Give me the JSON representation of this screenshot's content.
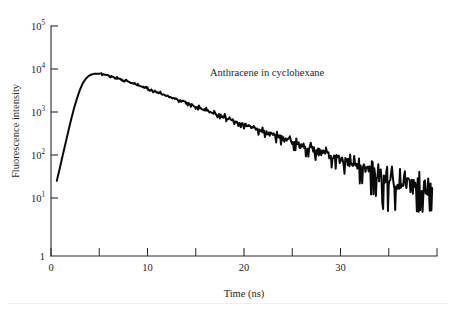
{
  "figure": {
    "annotation": "Anthracene in cyclohexane",
    "annotation_x": 210,
    "annotation_y": 76
  },
  "chart_data": {
    "type": "line",
    "title": "",
    "annotation": "Anthracene in cyclohexane",
    "xlabel": "Time (ns)",
    "ylabel": "Fluorescence intensity",
    "xscale": "linear",
    "yscale": "log",
    "xlim": [
      0,
      40
    ],
    "ylim": [
      1,
      100000
    ],
    "grid": false,
    "legend": null,
    "x_major_ticks": [
      0,
      10,
      20,
      30
    ],
    "x_major_tick_labels": [
      "0",
      "10",
      "20",
      "30"
    ],
    "x_minor_ticks": [
      5,
      15,
      25,
      35,
      40
    ],
    "y_ticks": [
      1,
      10,
      100,
      1000,
      10000,
      100000
    ],
    "y_tick_labels": [
      "1",
      "10",
      "10",
      "10",
      "10",
      "10"
    ],
    "y_tick_exponents": [
      "",
      "1",
      "2",
      "3",
      "4",
      "5"
    ],
    "series": [
      {
        "name": "Anthracene fluorescence decay",
        "color": "#0a0a0a",
        "peak_time_ns": 4.7,
        "peak_intensity": 7800,
        "lifetime_ns": 4.8,
        "x": [
          0.6,
          0.9,
          1.2,
          1.5,
          1.8,
          2.1,
          2.4,
          2.7,
          3.0,
          3.3,
          3.6,
          3.9,
          4.2,
          4.5,
          4.8,
          5.1,
          5.5,
          6.0,
          6.5,
          7.0,
          7.5,
          8.0,
          8.5,
          9.0,
          9.5,
          10.0,
          10.5,
          11.0,
          11.5,
          12.0,
          12.5,
          13.0,
          13.5,
          14.0,
          14.5,
          15.0,
          15.5,
          16.0,
          16.5,
          17.0,
          17.5,
          18.0,
          18.5,
          19.0,
          19.5,
          20.0,
          20.5,
          21.0,
          21.5,
          22.0,
          22.5,
          23.0,
          23.5,
          24.0,
          24.5,
          25.0,
          25.5,
          26.0,
          26.5,
          27.0,
          27.5,
          28.0,
          28.5,
          29.0,
          29.5,
          30.0,
          30.5,
          31.0,
          31.5,
          32.0,
          32.5,
          33.0,
          33.5,
          34.0,
          34.5,
          35.0,
          35.5,
          36.0,
          36.5,
          37.0,
          37.5,
          38.0,
          38.5,
          39.0,
          39.5
        ],
        "y": [
          25,
          48,
          95,
          185,
          360,
          690,
          1250,
          2100,
          3300,
          4700,
          5900,
          6900,
          7450,
          7750,
          7800,
          7700,
          7450,
          7000,
          6500,
          6000,
          5500,
          5050,
          4600,
          4200,
          3830,
          3500,
          3190,
          2900,
          2640,
          2400,
          2180,
          1980,
          1800,
          1640,
          1490,
          1355,
          1230,
          1120,
          1020,
          925,
          840,
          765,
          695,
          630,
          575,
          522,
          475,
          432,
          392,
          356,
          324,
          294,
          267,
          243,
          221,
          201,
          182,
          166,
          151,
          137,
          124,
          113,
          103,
          93,
          85,
          77,
          70,
          64,
          58,
          53,
          48,
          44,
          40,
          36,
          33,
          30,
          27,
          25,
          23,
          21,
          19,
          22,
          18,
          20,
          17
        ]
      }
    ]
  }
}
